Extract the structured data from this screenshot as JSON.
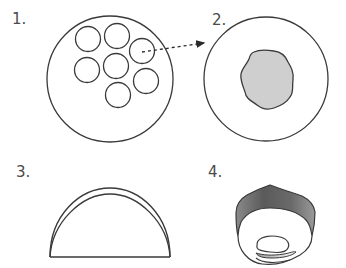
{
  "figure": {
    "panels": [
      {
        "id": "1",
        "label": "1.",
        "description": "Large circle containing seven small circles"
      },
      {
        "id": "2",
        "label": "2.",
        "description": "Large circle containing a gray irregular blob"
      },
      {
        "id": "3",
        "label": "3.",
        "description": "Half-dome with double arc outline"
      },
      {
        "id": "4",
        "label": "4.",
        "description": "Cup-shaped structure with shaded gray rim and inner fold"
      }
    ],
    "arrow": {
      "style": "dashed",
      "from_panel": "1",
      "to_panel": "2"
    },
    "colors": {
      "stroke": "#3a3a3a",
      "blob_fill": "#cfcfcf",
      "rim_dark": "#5a5a5a",
      "rim_light": "#bdbdbd",
      "label": "#4a4a4a"
    }
  }
}
